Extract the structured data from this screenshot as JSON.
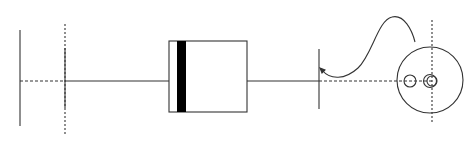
{
  "diagram": {
    "type": "optical-bench-schematic",
    "background": "#ffffff",
    "stroke_color": "#333333",
    "axis_y": 81,
    "elements": [
      {
        "name": "left-plate",
        "kind": "vertical-line",
        "x": 20,
        "y1": 30,
        "y2": 126
      },
      {
        "name": "lens-1",
        "kind": "vertical-line-with-dashed-extension",
        "x": 65,
        "solid_y1": 48,
        "solid_y2": 108,
        "dashed_y1": 24,
        "dashed_y2": 134
      },
      {
        "name": "filter-box",
        "kind": "rectangle",
        "x": 169,
        "y": 41,
        "width": 78,
        "height": 71,
        "stripe_x": 177,
        "stripe_width": 9
      },
      {
        "name": "lens-2",
        "kind": "vertical-line",
        "x": 319,
        "y1": 49,
        "y2": 109
      },
      {
        "name": "detector-disc",
        "kind": "circle",
        "cx": 430,
        "cy": 80,
        "r": 33
      },
      {
        "name": "pinhole-left",
        "kind": "circle",
        "cx": 410,
        "cy": 81,
        "r": 6
      },
      {
        "name": "pinhole-right-outer",
        "kind": "circle",
        "cx": 430,
        "cy": 81,
        "r": 6.5
      },
      {
        "name": "pinhole-right-inner",
        "kind": "circle",
        "cx": 432,
        "cy": 81,
        "r": 5
      },
      {
        "name": "detector-axis",
        "kind": "dashed-vertical",
        "x": 432,
        "y1": 20,
        "y2": 122
      },
      {
        "name": "cable",
        "kind": "curve",
        "from": [
          322,
          70
        ],
        "to": [
          415,
          42
        ]
      }
    ],
    "labels": []
  }
}
